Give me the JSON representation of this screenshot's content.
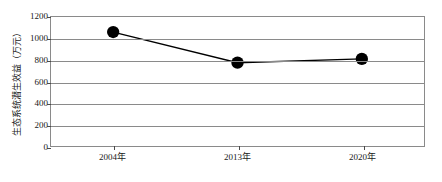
{
  "chart_data": {
    "type": "line",
    "title": "",
    "xlabel": "",
    "ylabel": "生态系统潜生效益（万元）",
    "categories": [
      "2004年",
      "2013年",
      "2020年"
    ],
    "values": [
      1060,
      775,
      810
    ],
    "series": [
      {
        "name": "生态系统潜生效益",
        "values": [
          1060,
          775,
          810
        ]
      }
    ],
    "ylim": [
      0,
      1200
    ],
    "ytick_labels": [
      "0",
      "200",
      "400",
      "600",
      "800",
      "1000",
      "1200"
    ],
    "ytick_values": [
      0,
      200,
      400,
      600,
      800,
      1000,
      1200
    ],
    "grid": "horizontal",
    "legend": "none",
    "marker": "filled-circle",
    "marker_color": "#000000",
    "line_color": "#000000",
    "axis_color": "#8a8a8a",
    "background": "#ffffff"
  }
}
